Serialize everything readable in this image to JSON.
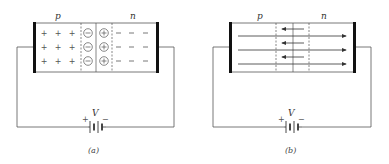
{
  "figure": {
    "panels": [
      {
        "id": "a",
        "caption": "(a)",
        "region_labels": {
          "p": "p",
          "n": "n"
        },
        "p_side_charges": "+",
        "depletion_p_ions": "−",
        "depletion_n_ions": "+",
        "n_side_charges": "−",
        "rows": 3,
        "battery": {
          "label": "V",
          "plus": "+",
          "minus": "−"
        }
      },
      {
        "id": "b",
        "caption": "(b)",
        "region_labels": {
          "p": "p",
          "n": "n"
        },
        "field_arrows": {
          "depletion": "leftward",
          "bulk": "rightward"
        },
        "battery": {
          "label": "V",
          "plus": "+",
          "minus": "−"
        }
      }
    ]
  }
}
